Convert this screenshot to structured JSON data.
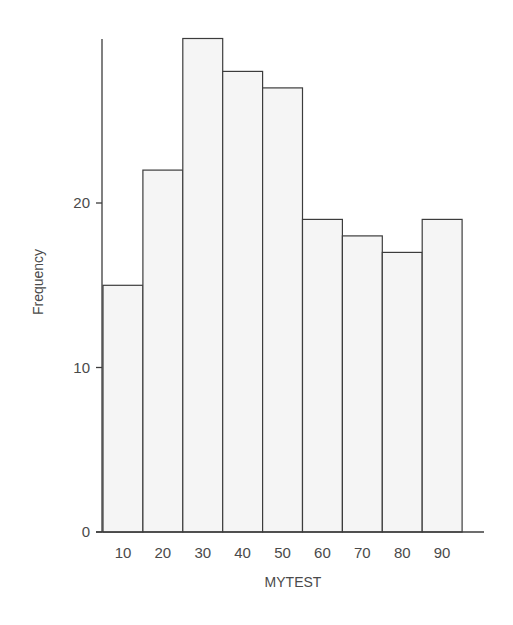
{
  "chart_data": {
    "type": "bar",
    "subtype": "histogram",
    "title": "",
    "xlabel": "MYTEST",
    "ylabel": "Frequency",
    "categories": [
      "10",
      "20",
      "30",
      "40",
      "50",
      "60",
      "70",
      "80",
      "90"
    ],
    "values": [
      15,
      22,
      30,
      28,
      27,
      19,
      18,
      17,
      19
    ],
    "yticks": [
      0,
      10,
      20
    ],
    "ylim": [
      0,
      30
    ],
    "grid": false,
    "legend": null,
    "colors": {
      "bar_fill": "#f5f5f5",
      "bar_stroke": "#3c3c3c",
      "text": "#4a4a4a"
    }
  }
}
